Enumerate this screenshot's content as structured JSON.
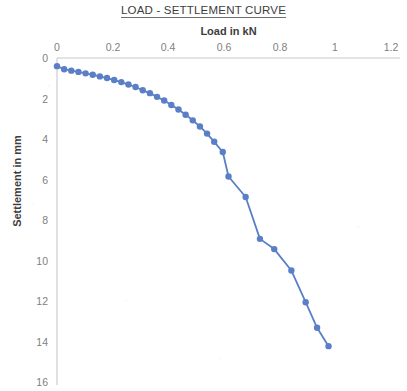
{
  "chart_data": {
    "type": "line",
    "title": "LOAD - SETTLEMENT CURVE",
    "xlabel": "Load in kN",
    "ylabel": "Settlement in mm",
    "xlim": [
      0,
      1.2
    ],
    "ylim": [
      0,
      16
    ],
    "y_axis_inverted": true,
    "grid": false,
    "legend": "none",
    "marker": "circle",
    "series_color": "#5B7FC7",
    "xticks": [
      "0",
      "0.2",
      "0.4",
      "0.6",
      "0.8",
      "1",
      "1.2"
    ],
    "xtick_values": [
      0,
      0.2,
      0.4,
      0.6,
      0.8,
      1,
      1.2
    ],
    "yticks": [
      "0",
      "2",
      "4",
      "6",
      "8",
      "10",
      "12",
      "14",
      "16"
    ],
    "ytick_values": [
      0,
      2,
      4,
      6,
      8,
      10,
      12,
      14,
      16
    ],
    "series": [
      {
        "name": "Load - Settlement",
        "x": [
          0.0,
          0.025,
          0.05,
          0.075,
          0.1,
          0.125,
          0.15,
          0.175,
          0.2,
          0.225,
          0.25,
          0.275,
          0.3,
          0.325,
          0.35,
          0.375,
          0.4,
          0.425,
          0.45,
          0.475,
          0.5,
          0.525,
          0.55,
          0.58,
          0.6,
          0.66,
          0.71,
          0.76,
          0.82,
          0.87,
          0.91,
          0.95
        ],
        "y": [
          0.4,
          0.55,
          0.62,
          0.68,
          0.75,
          0.82,
          0.9,
          0.98,
          1.08,
          1.18,
          1.3,
          1.42,
          1.58,
          1.72,
          1.9,
          2.08,
          2.3,
          2.52,
          2.78,
          3.05,
          3.35,
          3.7,
          4.1,
          4.6,
          5.8,
          6.8,
          8.85,
          9.35,
          10.4,
          11.95,
          13.2,
          14.1
        ]
      }
    ]
  }
}
